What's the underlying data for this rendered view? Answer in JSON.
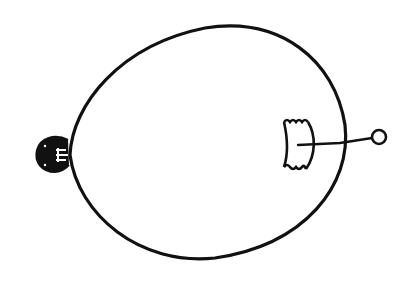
{
  "figure": {
    "stroke_color": "#111111",
    "background": "#ffffff",
    "parts": [
      {
        "name": "balloon-outline",
        "shape": "oval"
      },
      {
        "name": "knot",
        "position": "left"
      },
      {
        "name": "patch",
        "position": "right-inside"
      },
      {
        "name": "string",
        "position": "right"
      },
      {
        "name": "ring",
        "position": "right-end"
      }
    ]
  }
}
